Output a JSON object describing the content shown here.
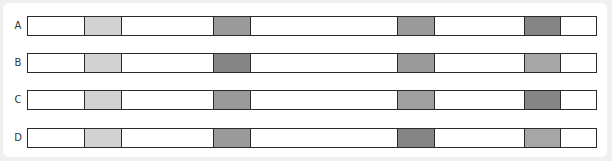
{
  "diagram": {
    "bar_left": 27,
    "bar_width": 568,
    "rows": [
      {
        "label": "A",
        "top": 16,
        "segments": [
          {
            "left": 56,
            "width": 38,
            "color": "#d2d2d2",
            "shade": "light"
          },
          {
            "left": 185,
            "width": 38,
            "color": "#9a9a9a",
            "shade": "medium"
          },
          {
            "left": 369,
            "width": 38,
            "color": "#9a9a9a",
            "shade": "medium"
          },
          {
            "left": 496,
            "width": 37,
            "color": "#858585",
            "shade": "dark"
          }
        ]
      },
      {
        "label": "B",
        "top": 53,
        "segments": [
          {
            "left": 56,
            "width": 38,
            "color": "#d2d2d2",
            "shade": "light"
          },
          {
            "left": 185,
            "width": 38,
            "color": "#858585",
            "shade": "dark"
          },
          {
            "left": 369,
            "width": 38,
            "color": "#9a9a9a",
            "shade": "medium"
          },
          {
            "left": 496,
            "width": 37,
            "color": "#a6a6a6",
            "shade": "medium-light"
          }
        ]
      },
      {
        "label": "C",
        "top": 90,
        "segments": [
          {
            "left": 56,
            "width": 38,
            "color": "#d2d2d2",
            "shade": "light"
          },
          {
            "left": 185,
            "width": 38,
            "color": "#9a9a9a",
            "shade": "medium"
          },
          {
            "left": 369,
            "width": 38,
            "color": "#9f9f9f",
            "shade": "medium"
          },
          {
            "left": 496,
            "width": 37,
            "color": "#858585",
            "shade": "dark"
          }
        ]
      },
      {
        "label": "D",
        "top": 128,
        "segments": [
          {
            "left": 56,
            "width": 38,
            "color": "#d2d2d2",
            "shade": "light"
          },
          {
            "left": 185,
            "width": 38,
            "color": "#9a9a9a",
            "shade": "medium"
          },
          {
            "left": 369,
            "width": 38,
            "color": "#858585",
            "shade": "dark"
          },
          {
            "left": 496,
            "width": 37,
            "color": "#a6a6a6",
            "shade": "medium-light"
          }
        ]
      }
    ]
  }
}
